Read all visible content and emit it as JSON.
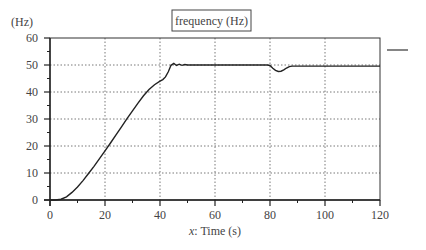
{
  "chart_data": {
    "type": "line",
    "title": "frequency (Hz)",
    "xlabel": "x: Time (s)",
    "xlabel_italic_prefix": "x",
    "xlabel_rest": ": Time (s)",
    "ylabel": "(Hz)",
    "xlim": [
      0,
      120
    ],
    "ylim": [
      0,
      60
    ],
    "x_ticks": [
      0,
      20,
      40,
      60,
      80,
      100,
      120
    ],
    "y_ticks": [
      0,
      10,
      20,
      30,
      40,
      50,
      60
    ],
    "grid": true,
    "grid_style": "dotted",
    "legend": {
      "position": "right",
      "entries": [
        ""
      ]
    },
    "series": [
      {
        "name": "frequency",
        "color": "#222222",
        "x": [
          0,
          2,
          4,
          6,
          8,
          10,
          12,
          14,
          16,
          18,
          20,
          22,
          24,
          26,
          28,
          30,
          32,
          34,
          36,
          38,
          40,
          41,
          42,
          43,
          44,
          45,
          46,
          47,
          48,
          49,
          50,
          60,
          70,
          79,
          80,
          81,
          82,
          83,
          84,
          85,
          86,
          87,
          88,
          89,
          90,
          100,
          110,
          120
        ],
        "values": [
          0,
          0,
          0.3,
          1.2,
          2.8,
          4.8,
          7.2,
          9.8,
          12.5,
          15.3,
          18.2,
          21.1,
          24.1,
          27.1,
          30.1,
          33.0,
          35.9,
          38.6,
          40.9,
          42.7,
          44.0,
          44.6,
          45.6,
          47.5,
          49.9,
          50.6,
          49.8,
          50.3,
          49.9,
          50.2,
          50.0,
          50.0,
          50.0,
          50.0,
          49.8,
          48.8,
          48.0,
          47.6,
          47.7,
          48.2,
          48.9,
          49.4,
          49.6,
          49.6,
          49.6,
          49.6,
          49.6,
          49.6
        ]
      }
    ]
  }
}
